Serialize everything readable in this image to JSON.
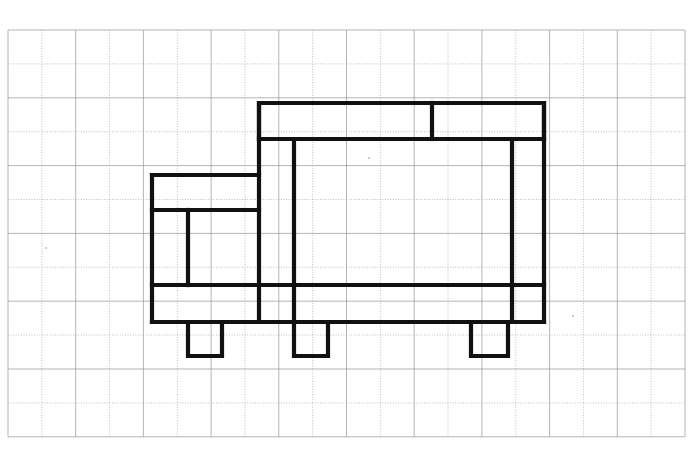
{
  "page": {
    "width": 694,
    "height": 449,
    "background_color": "#ffffff"
  },
  "grid": {
    "name": "graph-paper-grid",
    "origin_x": 8,
    "origin_y": 30,
    "cell_width": 33.85,
    "cell_height": 33.9,
    "columns": 20,
    "rows": 12,
    "line_color": "#8b8d92",
    "line_style": "alternating solid and fine dotted pencil rules",
    "right_edge": 685,
    "bottom_edge": 437
  },
  "drawing": {
    "name": "truck-outline",
    "description": "Heavy black outline drawing of a side-view truck traced on graph paper",
    "stroke_color": "#111111",
    "stroke_width": 4.2,
    "parts": [
      {
        "name": "cargo-box-top-band",
        "path": "M 259 103 L 544 103 L 544 139 L 259 139 Z"
      },
      {
        "name": "cargo-box-top-band-divider",
        "path": "M 432 103 L 432 139"
      },
      {
        "name": "cargo-box-left-wall",
        "path": "M 259 103 L 259 322"
      },
      {
        "name": "cargo-box-right-wall",
        "path": "M 544 103 L 544 322"
      },
      {
        "name": "cargo-box-inner-left-post",
        "path": "M 294 139 L 294 322"
      },
      {
        "name": "cargo-box-inner-right-post",
        "path": "M 512 139 L 512 322"
      },
      {
        "name": "cargo-box-floor-line",
        "path": "M 259 139 L 544 139"
      },
      {
        "name": "chassis-band-top",
        "path": "M 152 285 L 544 285"
      },
      {
        "name": "chassis-band-bottom",
        "path": "M 152 322 L 544 322"
      },
      {
        "name": "cab-roof",
        "path": "M 152 175 L 259 175"
      },
      {
        "name": "cab-left-wall",
        "path": "M 152 175 L 152 322"
      },
      {
        "name": "cab-window-sill",
        "path": "M 152 210 L 259 210"
      },
      {
        "name": "cab-window-divider",
        "path": "M 188 210 L 188 285"
      },
      {
        "name": "front-wheel",
        "path": "M 188 322 L 188 356 L 222 356 L 222 322"
      },
      {
        "name": "middle-wheel",
        "path": "M 294 322 L 294 356 L 328 356 L 328 322"
      },
      {
        "name": "rear-wheel",
        "path": "M 471 322 L 471 356 L 508 356 L 508 322"
      }
    ]
  }
}
